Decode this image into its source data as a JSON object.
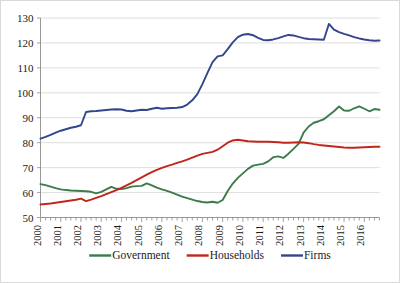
{
  "chart_data": {
    "type": "line",
    "title": "",
    "subtitle": "",
    "xlabel": "",
    "ylabel": "",
    "xlim": [
      2000,
      2016.75
    ],
    "ylim": [
      50,
      130
    ],
    "y_ticks": [
      50,
      60,
      70,
      80,
      90,
      100,
      110,
      120,
      130
    ],
    "x_tick_labels": [
      "2000",
      "2001",
      "2002",
      "2003",
      "2004",
      "2005",
      "2006",
      "2007",
      "2008",
      "2009",
      "2010",
      "2011",
      "2012",
      "2013",
      "2014",
      "2015",
      "2016"
    ],
    "grid": "horizontal",
    "legend_position": "bottom",
    "minor_ticks_per_year": 4,
    "x_quarterly": [
      2000.0,
      2000.25,
      2000.5,
      2000.75,
      2001.0,
      2001.25,
      2001.5,
      2001.75,
      2002.0,
      2002.25,
      2002.5,
      2002.75,
      2003.0,
      2003.25,
      2003.5,
      2003.75,
      2004.0,
      2004.25,
      2004.5,
      2004.75,
      2005.0,
      2005.25,
      2005.5,
      2005.75,
      2006.0,
      2006.25,
      2006.5,
      2006.75,
      2007.0,
      2007.25,
      2007.5,
      2007.75,
      2008.0,
      2008.25,
      2008.5,
      2008.75,
      2009.0,
      2009.25,
      2009.5,
      2009.75,
      2010.0,
      2010.25,
      2010.5,
      2010.75,
      2011.0,
      2011.25,
      2011.5,
      2011.75,
      2012.0,
      2012.25,
      2012.5,
      2012.75,
      2013.0,
      2013.25,
      2013.5,
      2013.75,
      2014.0,
      2014.25,
      2014.5,
      2014.75,
      2015.0,
      2015.25,
      2015.5,
      2015.75,
      2016.0,
      2016.25,
      2016.5,
      2016.75
    ],
    "series": [
      {
        "name": "Government",
        "color": "#3d7a4c",
        "values": [
          63.4,
          63.0,
          62.4,
          61.8,
          61.3,
          61.0,
          60.8,
          60.7,
          60.6,
          60.5,
          60.3,
          59.7,
          60.3,
          61.3,
          62.3,
          61.5,
          61.4,
          61.8,
          62.4,
          62.6,
          62.7,
          63.7,
          62.9,
          62.0,
          61.3,
          60.7,
          60.0,
          59.2,
          58.4,
          57.8,
          57.2,
          56.6,
          56.2,
          56.0,
          56.3,
          55.9,
          57.0,
          60.6,
          63.6,
          65.9,
          67.7,
          69.5,
          70.8,
          71.2,
          71.5,
          72.5,
          74.2,
          74.5,
          73.9,
          75.6,
          77.5,
          79.5,
          84.0,
          86.5,
          88.0,
          88.6,
          89.4,
          91.0,
          92.6,
          94.5,
          92.9,
          92.8,
          93.8,
          94.6,
          93.6,
          92.6,
          93.5,
          93.2
        ]
      },
      {
        "name": "Households",
        "color": "#c0271a",
        "values": [
          55.2,
          55.4,
          55.6,
          55.9,
          56.2,
          56.5,
          56.8,
          57.1,
          57.6,
          56.6,
          57.2,
          57.9,
          58.6,
          59.4,
          60.2,
          61.0,
          61.9,
          62.9,
          63.9,
          65.0,
          66.1,
          67.2,
          68.2,
          69.1,
          69.9,
          70.6,
          71.2,
          71.9,
          72.5,
          73.2,
          74.0,
          74.8,
          75.5,
          75.9,
          76.3,
          77.2,
          78.6,
          80.0,
          80.9,
          81.2,
          80.9,
          80.6,
          80.5,
          80.4,
          80.4,
          80.4,
          80.3,
          80.2,
          80.0,
          80.0,
          80.1,
          80.2,
          80.1,
          79.8,
          79.4,
          79.1,
          78.9,
          78.7,
          78.5,
          78.3,
          78.1,
          78.0,
          78.0,
          78.1,
          78.2,
          78.3,
          78.4,
          78.4
        ]
      },
      {
        "name": "Firms",
        "color": "#33458c",
        "values": [
          81.6,
          82.3,
          83.1,
          84.0,
          84.8,
          85.4,
          86.0,
          86.4,
          87.0,
          92.3,
          92.6,
          92.7,
          92.9,
          93.1,
          93.3,
          93.4,
          93.3,
          92.8,
          92.6,
          92.9,
          93.2,
          93.1,
          93.6,
          94.0,
          93.6,
          93.8,
          93.9,
          94.0,
          94.3,
          95.3,
          97.0,
          99.5,
          103.5,
          108.0,
          112.3,
          114.6,
          115.0,
          117.5,
          120.2,
          122.3,
          123.3,
          123.6,
          123.1,
          122.0,
          121.2,
          121.1,
          121.4,
          121.9,
          122.6,
          123.2,
          123.0,
          122.4,
          121.9,
          121.6,
          121.5,
          121.4,
          121.3,
          127.6,
          125.3,
          124.3,
          123.6,
          123.0,
          122.3,
          121.8,
          121.4,
          121.1,
          120.9,
          121.0
        ]
      }
    ]
  },
  "legend": {
    "items": [
      {
        "label": "Government",
        "color": "#3d7a4c"
      },
      {
        "label": "Households",
        "color": "#c0271a"
      },
      {
        "label": "Firms",
        "color": "#33458c"
      }
    ]
  }
}
